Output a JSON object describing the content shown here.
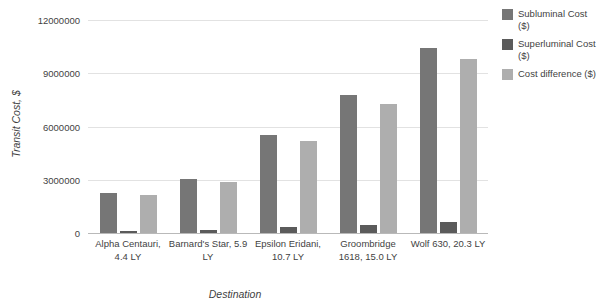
{
  "chart_data": {
    "type": "bar",
    "title": "",
    "subtitle": "",
    "xlabel": "Destination",
    "ylabel": "Transit Cost, $",
    "ylim": [
      0,
      12000000
    ],
    "ytick_labels": [
      "0",
      "3000000",
      "6000000",
      "9000000",
      "12000000"
    ],
    "ytick_values": [
      0,
      3000000,
      6000000,
      9000000,
      12000000
    ],
    "grid": true,
    "legend_position": "right",
    "categories": [
      "Alpha Centauri, 4.4 LY",
      "Barnard's Star, 5.9 LY",
      "Epsilon Eridani, 10.7 LY",
      "Groombridge 1618, 15.0 LY",
      "Wolf 630, 20.3 LY"
    ],
    "series": [
      {
        "name": "Subluminal Cost ($)",
        "color": "#767676",
        "values": [
          2250000,
          3050000,
          5500000,
          7750000,
          10400000
        ]
      },
      {
        "name": "Superluminal Cost ($)",
        "color": "#5b5b5b",
        "values": [
          130000,
          180000,
          320000,
          470000,
          600000
        ]
      },
      {
        "name": "Cost difference ($)",
        "color": "#aeaeae",
        "values": [
          2120000,
          2870000,
          5180000,
          7280000,
          9800000
        ]
      }
    ]
  },
  "axes": {
    "y_title": "Transit Cost, $",
    "x_title": "Destination"
  },
  "legend": {
    "items": [
      {
        "label": "Subluminal Cost ($)"
      },
      {
        "label": "Superluminal Cost ($)"
      },
      {
        "label": "Cost difference ($)"
      }
    ]
  }
}
